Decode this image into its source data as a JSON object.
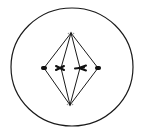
{
  "diagram": {
    "components": {
      "cell_membrane": "cell-membrane",
      "spindle_poles": [
        "top-pole",
        "bottom-pole"
      ],
      "chromosome_count": 4,
      "chromosome_alignment": "metaphase plate"
    },
    "colors": {
      "stroke": "#1a1a1a",
      "background": "#ffffff",
      "chromosome": "#111111"
    }
  }
}
